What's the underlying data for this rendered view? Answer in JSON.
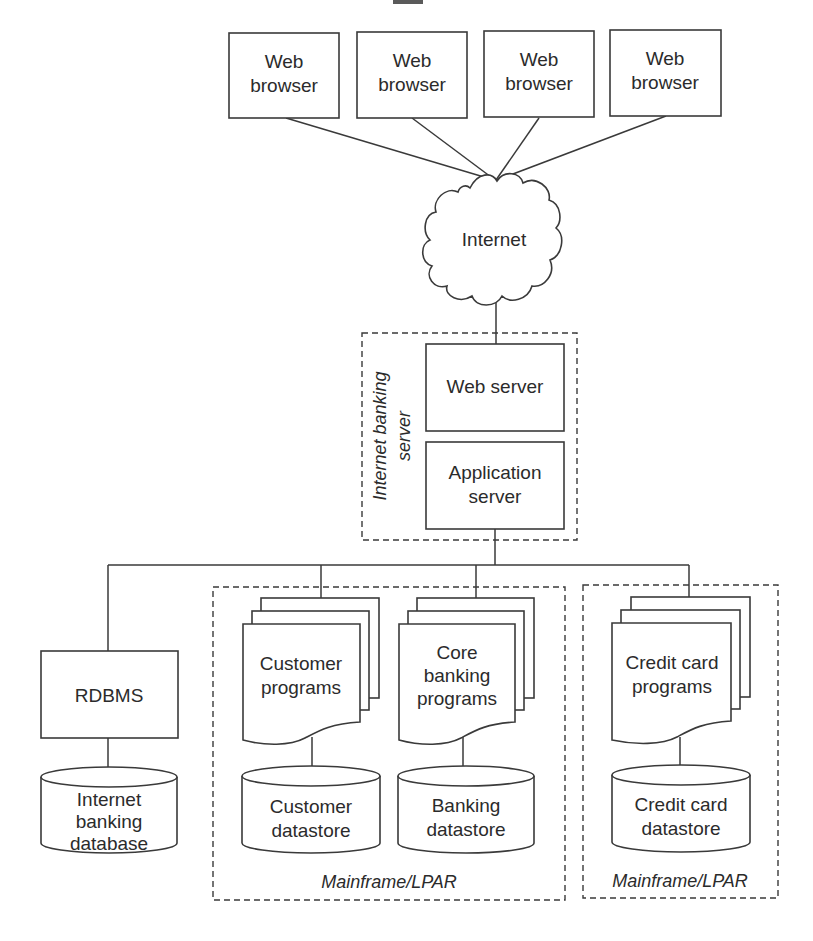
{
  "diagram": {
    "type": "architecture",
    "clients": [
      {
        "label_line1": "Web",
        "label_line2": "browser"
      },
      {
        "label_line1": "Web",
        "label_line2": "browser"
      },
      {
        "label_line1": "Web",
        "label_line2": "browser"
      },
      {
        "label_line1": "Web",
        "label_line2": "browser"
      }
    ],
    "network": {
      "label": "Internet"
    },
    "server_group": {
      "label_line1": "Internet banking",
      "label_line2": "server",
      "web_server": {
        "label": "Web server"
      },
      "app_server": {
        "label_line1": "Application",
        "label_line2": "server"
      }
    },
    "rdbms": {
      "label": "RDBMS",
      "database": {
        "label_line1": "Internet",
        "label_line2": "banking",
        "label_line3": "database"
      }
    },
    "mainframe1": {
      "label": "Mainframe/LPAR",
      "customer_programs": {
        "label_line1": "Customer",
        "label_line2": "programs"
      },
      "customer_datastore": {
        "label_line1": "Customer",
        "label_line2": "datastore"
      },
      "core_programs": {
        "label_line1": "Core",
        "label_line2": "banking",
        "label_line3": "programs"
      },
      "banking_datastore": {
        "label_line1": "Banking",
        "label_line2": "datastore"
      }
    },
    "mainframe2": {
      "label": "Mainframe/LPAR",
      "credit_programs": {
        "label_line1": "Credit card",
        "label_line2": "programs"
      },
      "credit_datastore": {
        "label_line1": "Credit card",
        "label_line2": "datastore"
      }
    },
    "edges": [
      [
        "Web browser 1",
        "Internet"
      ],
      [
        "Web browser 2",
        "Internet"
      ],
      [
        "Web browser 3",
        "Internet"
      ],
      [
        "Web browser 4",
        "Internet"
      ],
      [
        "Internet",
        "Web server"
      ],
      [
        "Application server",
        "RDBMS"
      ],
      [
        "Application server",
        "Customer programs"
      ],
      [
        "Application server",
        "Core banking programs"
      ],
      [
        "Application server",
        "Credit card programs"
      ],
      [
        "RDBMS",
        "Internet banking database"
      ],
      [
        "Customer programs",
        "Customer datastore"
      ],
      [
        "Core banking programs",
        "Banking datastore"
      ],
      [
        "Credit card programs",
        "Credit card datastore"
      ]
    ]
  }
}
